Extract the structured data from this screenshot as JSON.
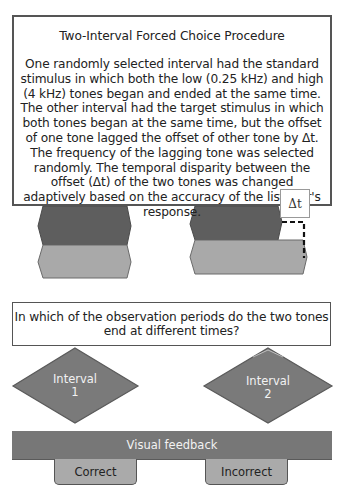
{
  "intro": {
    "title": "Two-Interval Forced Choice Procedure",
    "body": "One randomly selected interval had the standard stimulus in which both the low (0.25 kHz) and high (4 kHz) tones began and ended at the same time. The other interval had the target stimulus in which both tones began at the same time, but the offset of one tone lagged the offset of other tone by Δt. The frequency of the lagging tone was selected randomly. The temporal disparity between the offset (Δt) of the two tones was changed adaptively based on the accuracy of the listener's response."
  },
  "stimuli": {
    "delta_label": "Δt",
    "standard": {
      "high_tone": "dark",
      "low_tone": "light"
    },
    "target": {
      "high_tone": "dark",
      "low_tone": "light-lagging"
    }
  },
  "question": "In which of the observation periods do the two tones end at different times?",
  "choices": [
    {
      "line1": "Interval",
      "line2": "1"
    },
    {
      "line1": "Interval",
      "line2": "2"
    }
  ],
  "feedback": {
    "label": "Visual feedback",
    "correct": "Correct",
    "incorrect": "Incorrect"
  },
  "colors": {
    "dark_tone": "#5e5e5e",
    "light_tone": "#a9a9a9",
    "diamond": "#7a7a7a",
    "feedback_bar": "#777777",
    "button": "#aaaaaa",
    "border": "#555555"
  }
}
